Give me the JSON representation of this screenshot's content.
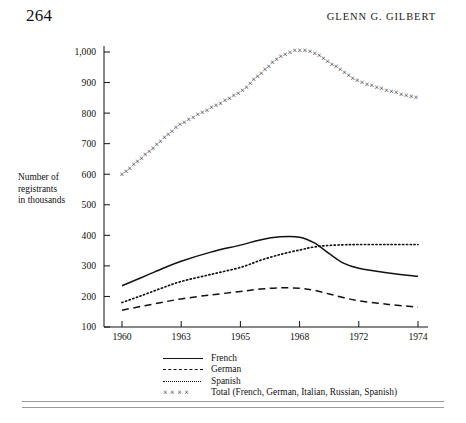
{
  "header": {
    "page_number": "264",
    "running_head": "GLENN G. GILBERT"
  },
  "figure": {
    "y_axis_title_line1": "Number of",
    "y_axis_title_line2": "registrants",
    "y_axis_title_line3": "in thousands"
  },
  "legend": {
    "items": [
      {
        "label": "French",
        "style": "solid",
        "sample": ""
      },
      {
        "label": "German",
        "style": "dashed",
        "sample": ""
      },
      {
        "label": "Spanish",
        "style": "dotted",
        "sample": ""
      },
      {
        "label": "Total (French, German, Italian, Russian, Spanish)",
        "style": "cross",
        "sample": "××××"
      }
    ]
  },
  "chart_data": {
    "type": "line",
    "title": "",
    "xlabel": "",
    "ylabel": "Number of registrants in thousands",
    "xlim": [
      1960,
      1974
    ],
    "ylim": [
      100,
      1000
    ],
    "grid": false,
    "legend_position": "below",
    "x_tick_labels": [
      "1960",
      "1963",
      "1965",
      "1968",
      "1972",
      "1974"
    ],
    "x_tick_values": [
      1960,
      1963,
      1965,
      1968,
      1972,
      1974
    ],
    "y_tick_labels": [
      "100",
      "200",
      "300",
      "400",
      "500",
      "600",
      "700",
      "800",
      "900",
      "1,000"
    ],
    "y_tick_values": [
      100,
      200,
      300,
      400,
      500,
      600,
      700,
      800,
      900,
      1000
    ],
    "x": [
      1960,
      1961,
      1962,
      1963,
      1964,
      1965,
      1966,
      1967,
      1968,
      1969,
      1970,
      1971,
      1972,
      1973,
      1974
    ],
    "series": [
      {
        "name": "French",
        "style": "solid",
        "values": [
          235,
          262,
          290,
          315,
          345,
          368,
          385,
          395,
          394,
          375,
          340,
          308,
          292,
          277,
          266
        ]
      },
      {
        "name": "German",
        "style": "dashed",
        "values": [
          155,
          168,
          180,
          192,
          205,
          216,
          224,
          228,
          227,
          220,
          208,
          196,
          186,
          174,
          165
        ]
      },
      {
        "name": "Spanish",
        "style": "dotted",
        "values": [
          180,
          203,
          227,
          249,
          272,
          295,
          318,
          337,
          352,
          362,
          367,
          369,
          370,
          370,
          370
        ]
      },
      {
        "name": "Total (French, German, Italian, Russian, Spanish)",
        "style": "cross",
        "values": [
          600,
          655,
          712,
          766,
          818,
          872,
          930,
          985,
          1008,
          998,
          968,
          935,
          905,
          875,
          850
        ]
      }
    ]
  }
}
